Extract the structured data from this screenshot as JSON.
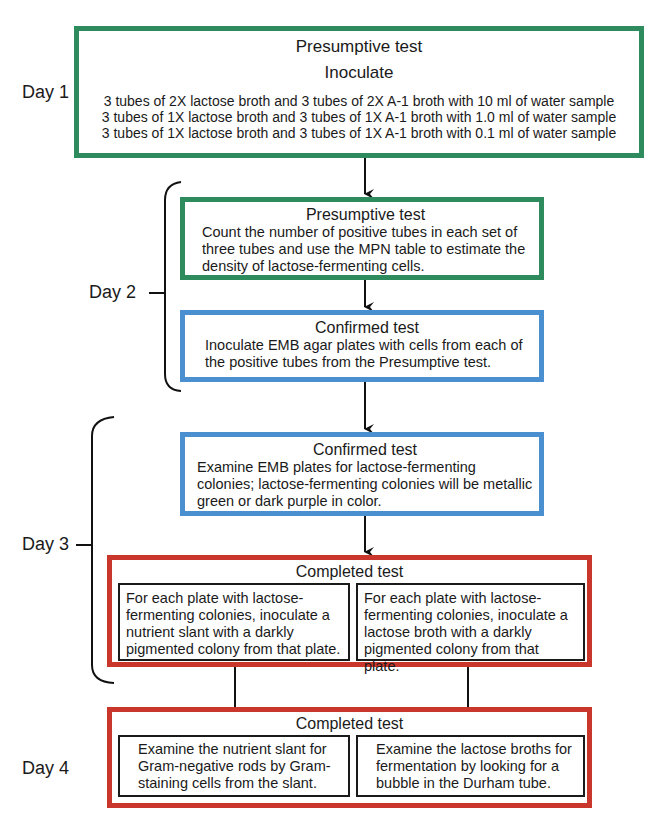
{
  "days": {
    "day1": "Day 1",
    "day2": "Day 2",
    "day3": "Day 3",
    "day4": "Day 4"
  },
  "step1": {
    "title": "Presumptive test",
    "subtitle": "Inoculate",
    "lines": [
      "3 tubes of 2X lactose broth and 3 tubes of 2X A-1 broth with 10 ml of water sample",
      "3 tubes of 1X lactose broth and 3 tubes of 1X A-1 broth with 1.0 ml of water sample",
      "3 tubes of 1X lactose broth and 3 tubes of 1X A-1 broth with 0.1 ml of water sample"
    ]
  },
  "step2": {
    "title": "Presumptive test",
    "text": "Count the number of positive tubes in each set of three tubes and use the MPN table to estimate the density of lactose-fermenting cells."
  },
  "step3": {
    "title": "Confirmed test",
    "text": "Inoculate EMB agar plates with cells from each of the positive tubes from the Presumptive test."
  },
  "step4": {
    "title": "Confirmed test",
    "text": "Examine EMB plates for lactose-fermenting colonies; lactose-fermenting colonies will be metallic green or dark purple in color."
  },
  "step5": {
    "title": "Completed test",
    "left": "For each plate with lactose-fermenting colonies, inoculate a nutrient slant with a darkly pigmented colony from that plate.",
    "right": "For each plate with lactose-fermenting colonies, inoculate a lactose broth with a darkly pigmented colony from that plate."
  },
  "step6": {
    "title": "Completed test",
    "left": "Examine the nutrient slant for Gram-negative rods by Gram-staining cells from the slant.",
    "right": "Examine the lactose broths for fermentation by looking for a bubble in the Durham tube."
  },
  "colors": {
    "presumptive": "#2e8b5e",
    "confirmed": "#4a8fd0",
    "completed": "#c9372c"
  }
}
